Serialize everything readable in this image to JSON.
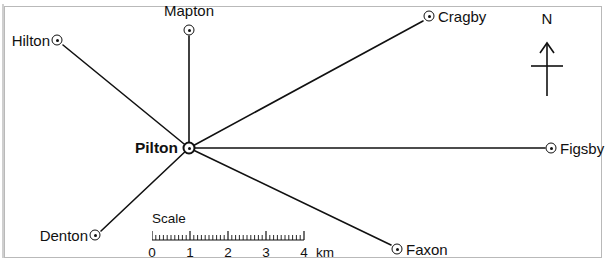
{
  "figure": {
    "kind": "route-map",
    "width": 608,
    "height": 266,
    "background_color": "#ffffff",
    "frame_color": "#b9b9b9",
    "ink_color": "#111111"
  },
  "hub": {
    "name": "Pilton",
    "x": 189,
    "y": 148,
    "marker": "circle-dot-marker",
    "label_side": "left",
    "bold": true
  },
  "places": [
    {
      "name": "Mapton",
      "x": 189,
      "y": 30,
      "label_x": 189,
      "label_y": 18,
      "label_side": "above",
      "marker": "circle-dot-marker"
    },
    {
      "name": "Hilton",
      "x": 57,
      "y": 40,
      "label_x": 50,
      "label_y": 40,
      "label_side": "left",
      "marker": "circle-dot-marker"
    },
    {
      "name": "Cragby",
      "x": 429,
      "y": 16,
      "label_x": 438,
      "label_y": 16,
      "label_side": "right",
      "marker": "circle-dot-marker"
    },
    {
      "name": "Figsby",
      "x": 551,
      "y": 148,
      "label_x": 560,
      "label_y": 148,
      "label_side": "right",
      "marker": "circle-dot-marker"
    },
    {
      "name": "Faxon",
      "x": 397,
      "y": 249,
      "label_x": 406,
      "label_y": 249,
      "label_side": "right",
      "marker": "circle-dot-marker"
    },
    {
      "name": "Denton",
      "x": 95,
      "y": 235,
      "label_x": 88,
      "label_y": 235,
      "label_side": "left",
      "marker": "circle-dot-marker"
    }
  ],
  "hub_label_position": {
    "x": 178,
    "y": 148
  },
  "routes": [
    {
      "from": "Pilton",
      "to": "Mapton",
      "x1": 189,
      "y1": 148,
      "x2": 189,
      "y2": 36
    },
    {
      "from": "Pilton",
      "to": "Hilton",
      "x1": 189,
      "y1": 148,
      "x2": 63,
      "y2": 45
    },
    {
      "from": "Pilton",
      "to": "Cragby",
      "x1": 189,
      "y1": 148,
      "x2": 423,
      "y2": 21
    },
    {
      "from": "Pilton",
      "to": "Figsby",
      "x1": 189,
      "y1": 148,
      "x2": 545,
      "y2": 148
    },
    {
      "from": "Pilton",
      "to": "Faxon",
      "x1": 189,
      "y1": 148,
      "x2": 391,
      "y2": 245
    },
    {
      "from": "Pilton",
      "to": "Denton",
      "x1": 189,
      "y1": 148,
      "x2": 101,
      "y2": 231
    }
  ],
  "compass": {
    "label": "N",
    "icon": "north-arrow-icon",
    "x": 547,
    "top": 38,
    "bottom": 96,
    "crossbar_y": 66
  },
  "scale": {
    "caption": "Scale",
    "unit": "km",
    "tick_labels": [
      "0",
      "1",
      "2",
      "3",
      "4"
    ],
    "major_count": 5,
    "minor_per_major": 10,
    "pixels_per_km": 38,
    "length_px": 152,
    "min_km": 0,
    "max_km": 4
  }
}
